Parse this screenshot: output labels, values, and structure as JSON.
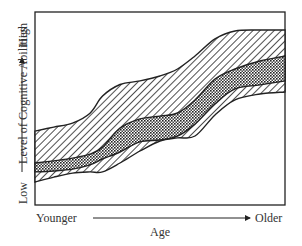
{
  "chart_data": {
    "type": "area",
    "title": "",
    "xlabel": "Age",
    "ylabel": "Level of Cognitive Abilities",
    "x_axis": {
      "start_label": "Younger",
      "end_label": "Older",
      "range": [
        0,
        100
      ]
    },
    "y_axis": {
      "low_label": "Low",
      "high_label": "High",
      "range": [
        0,
        100
      ]
    },
    "grid": false,
    "legend": null,
    "x": [
      0,
      7.5,
      15,
      22,
      27,
      34,
      42,
      50,
      57,
      64,
      72,
      80,
      90,
      100
    ],
    "series": [
      {
        "name": "outer-band",
        "pattern": "diagonal-hatch",
        "upper": [
          38.9,
          41.0,
          43.1,
          48.3,
          57.3,
          63.4,
          65.3,
          67.9,
          71.6,
          78.4,
          87.4,
          91.6,
          92.1,
          92.1
        ],
        "lower": [
          12.1,
          14.7,
          16.8,
          17.4,
          17.4,
          22.1,
          28.4,
          33.7,
          35.3,
          36.3,
          47.4,
          55.3,
          58.4,
          59.5
        ]
      },
      {
        "name": "inner-band",
        "pattern": "dotted",
        "upper": [
          22.1,
          23.2,
          24.7,
          26.8,
          30.5,
          40.5,
          45.3,
          46.8,
          48.4,
          55.3,
          66.3,
          71.6,
          75.8,
          78.4
        ],
        "lower": [
          17.4,
          17.9,
          18.9,
          21.1,
          24.2,
          27.9,
          33.2,
          34.2,
          36.3,
          42.6,
          53.2,
          61.1,
          63.2,
          65.3
        ]
      }
    ]
  }
}
